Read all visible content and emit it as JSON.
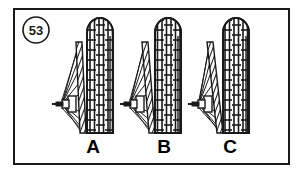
{
  "figure": {
    "number_badge": "53",
    "badge_shape": "circle",
    "frame_color": "#1a1a1a",
    "background_color": "#ffffff",
    "ink_color": "#1a1a1a",
    "caption_labels": [
      "A",
      "B",
      "C"
    ],
    "panel_count": 3
  },
  "panels": [
    {
      "id": "panel-a",
      "label": "A",
      "label_x": 93,
      "label_y": 152,
      "tire": {
        "center_x": 100,
        "top_y": 20,
        "bottom_y": 133,
        "width": 26,
        "tread_rows": 11,
        "tread_cols": 3
      },
      "rim": {
        "top_x": 77,
        "bottom_x": 82,
        "top_y": 42,
        "bottom_y": 133,
        "width": 6,
        "lean": "slight"
      },
      "hub": {
        "x": 60,
        "y": 104,
        "axle_length": 16
      },
      "spoke_count": 9
    },
    {
      "id": "panel-b",
      "label": "B",
      "label_x": 164,
      "label_y": 152,
      "tire": {
        "center_x": 168,
        "top_y": 20,
        "bottom_y": 133,
        "width": 26,
        "tread_rows": 11,
        "tread_cols": 3
      },
      "rim": {
        "top_x": 143,
        "bottom_x": 150,
        "top_y": 42,
        "bottom_y": 133,
        "width": 6,
        "lean": "moderate"
      },
      "hub": {
        "x": 128,
        "y": 104,
        "axle_length": 16
      },
      "spoke_count": 9
    },
    {
      "id": "panel-c",
      "label": "C",
      "label_x": 230,
      "label_y": 152,
      "tire": {
        "center_x": 236,
        "top_y": 20,
        "bottom_y": 133,
        "width": 26,
        "tread_rows": 11,
        "tread_cols": 3
      },
      "rim": {
        "top_x": 208,
        "bottom_x": 218,
        "top_y": 42,
        "bottom_y": 133,
        "width": 6,
        "lean": "strong"
      },
      "hub": {
        "x": 196,
        "y": 104,
        "axle_length": 16
      },
      "spoke_count": 9
    }
  ]
}
